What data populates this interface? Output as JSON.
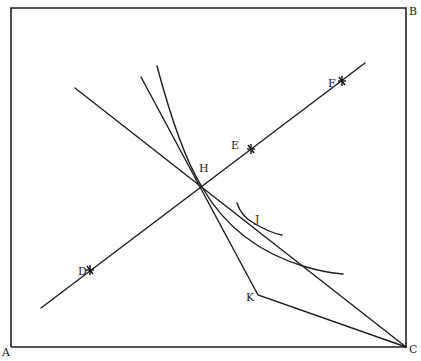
{
  "figure": {
    "type": "geometric-diagram",
    "frame": {
      "corners": {
        "A": {
          "label": "A",
          "x": 11,
          "y": 347
        },
        "B": {
          "label": "B",
          "x": 406,
          "y": 8
        },
        "C": {
          "label": "C",
          "x": 406,
          "y": 347
        }
      }
    },
    "points": {
      "D": {
        "label": "D",
        "x": 90,
        "y": 270,
        "marker": "star"
      },
      "E": {
        "label": "E",
        "x": 251,
        "y": 149,
        "marker": "star"
      },
      "F": {
        "label": "F",
        "x": 342,
        "y": 81,
        "marker": "star"
      },
      "H": {
        "label": "H",
        "x": 202,
        "y": 187,
        "marker": "intersection"
      },
      "J": {
        "label": "J",
        "x": 250,
        "y": 221,
        "marker": "tangency"
      },
      "K": {
        "label": "K",
        "x": 258,
        "y": 295,
        "marker": "vertex"
      }
    },
    "lines": [
      {
        "name": "line-DEF",
        "from": [
          41,
          308
        ],
        "to": [
          365,
          63
        ]
      },
      {
        "name": "line-through-H-to-C",
        "from": [
          75,
          88
        ],
        "to": [
          406,
          347
        ]
      },
      {
        "name": "line-steep-to-K",
        "from": [
          141,
          77
        ],
        "to": [
          258,
          295
        ]
      },
      {
        "name": "line-K-to-C",
        "from": [
          258,
          295
        ],
        "to": [
          406,
          347
        ]
      }
    ],
    "curves": [
      {
        "name": "curve-through-H",
        "desc": "convex curve from top passing through H and descending to the right"
      },
      {
        "name": "curve-J",
        "desc": "short convex curve tangent near point J"
      }
    ],
    "colors": {
      "ink": "#1e1e1e",
      "background": "#ffffff"
    }
  }
}
